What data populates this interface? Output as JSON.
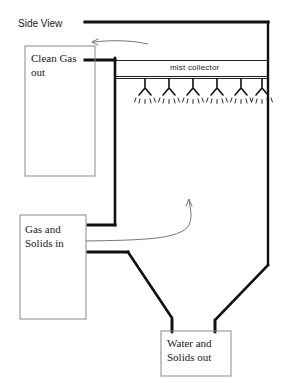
{
  "diagram": {
    "title": "Side View",
    "type": "wet-scrubber-side-view-schematic",
    "stroke_color": "#111111",
    "thin_stroke_color": "#555555",
    "box_border_color": "#888888",
    "background": "#ffffff",
    "labels": {
      "clean_gas_out": "Clean Gas\nout",
      "gas_and_solids_in": "Gas and\nSolids in",
      "water_and_solids_out": "Water and\nSolids out",
      "mist_collector": "mist collector"
    },
    "nozzle_count": 6,
    "flow_arrows": [
      {
        "name": "clean-gas-out-arrow",
        "direction": "left"
      },
      {
        "name": "gas-flow-up-arrow",
        "direction": "up"
      }
    ]
  }
}
